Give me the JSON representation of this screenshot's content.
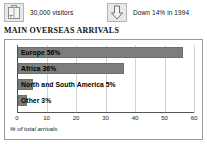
{
  "stats": [
    {
      "icon": "suitcase-icon",
      "text": "30,000 visitors"
    },
    {
      "icon": "down-arrow-icon",
      "text": "Down 14% in 1994"
    }
  ],
  "section_title": "MAIN OVERSEAS ARRIVALS",
  "colors": {
    "bar": "#7d7d7d",
    "bar_border": "#6e6e6e",
    "grid": "#d2d2d2",
    "axis": "#555555",
    "frame_border": "#9a9a9a",
    "background": "#ffffff",
    "text": "#111111"
  },
  "chart_data": {
    "type": "bar",
    "orientation": "horizontal",
    "title": "MAIN OVERSEAS ARRIVALS",
    "xlabel": "% of total arrivals",
    "ylabel": "",
    "xlim": [
      0,
      60
    ],
    "ticks": [
      0,
      10,
      20,
      30,
      40,
      50,
      60
    ],
    "grid": true,
    "legend": false,
    "categories": [
      "Europe",
      "Africa",
      "North and South America",
      "Other"
    ],
    "values": [
      56,
      36,
      5,
      3
    ],
    "bar_labels": [
      "Europe 56%",
      "Africa 36%",
      "North and South America 5%",
      "Other 3%"
    ]
  }
}
